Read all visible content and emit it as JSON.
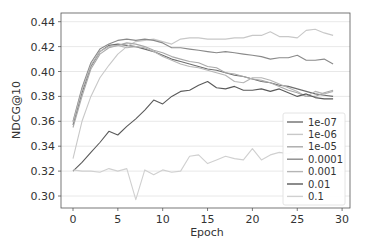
{
  "chart_data": {
    "type": "line",
    "title": "",
    "xlabel": "Epoch",
    "ylabel": "NDCG@10",
    "xlim": [
      -1.3,
      31
    ],
    "ylim": [
      0.29,
      0.445
    ],
    "xticks": [
      0,
      5,
      10,
      15,
      20,
      25,
      30
    ],
    "yticks": [
      0.3,
      0.32,
      0.34,
      0.36,
      0.38,
      0.4,
      0.42,
      0.44
    ],
    "ytick_labels": [
      "0.30",
      "0.32",
      "0.34",
      "0.36",
      "0.38",
      "0.40",
      "0.42",
      "0.44"
    ],
    "grid": "horizontal",
    "legend_position": "lower right",
    "x": [
      0,
      1,
      2,
      3,
      4,
      5,
      6,
      7,
      8,
      9,
      10,
      11,
      12,
      13,
      14,
      15,
      16,
      17,
      18,
      19,
      20,
      21,
      22,
      23,
      24,
      25,
      26,
      27,
      28,
      29
    ],
    "series": [
      {
        "name": "1e-07",
        "color": "#6e6e6e",
        "values": [
          0.357,
          0.383,
          0.404,
          0.416,
          0.421,
          0.422,
          0.421,
          0.42,
          0.418,
          0.416,
          0.413,
          0.41,
          0.408,
          0.406,
          0.404,
          0.402,
          0.401,
          0.399,
          0.397,
          0.396,
          0.394,
          0.392,
          0.391,
          0.389,
          0.388,
          0.386,
          0.384,
          0.382,
          0.381,
          0.38
        ]
      },
      {
        "name": "1e-06",
        "color": "#c8c8c8",
        "values": [
          0.33,
          0.36,
          0.38,
          0.395,
          0.405,
          0.414,
          0.42,
          0.424,
          0.425,
          0.426,
          0.424,
          0.422,
          0.426,
          0.427,
          0.427,
          0.426,
          0.426,
          0.426,
          0.427,
          0.427,
          0.429,
          0.429,
          0.432,
          0.428,
          0.428,
          0.427,
          0.433,
          0.434,
          0.431,
          0.429
        ]
      },
      {
        "name": "1e-05",
        "color": "#a9a9a9",
        "values": [
          0.355,
          0.38,
          0.402,
          0.414,
          0.419,
          0.421,
          0.423,
          0.422,
          0.42,
          0.417,
          0.415,
          0.412,
          0.41,
          0.408,
          0.407,
          0.404,
          0.403,
          0.399,
          0.398,
          0.396,
          0.394,
          0.393,
          0.391,
          0.388,
          0.385,
          0.383,
          0.38,
          0.38,
          0.383,
          0.385
        ]
      },
      {
        "name": "0.0001",
        "color": "#8a8a8a",
        "values": [
          0.36,
          0.387,
          0.407,
          0.418,
          0.422,
          0.425,
          0.426,
          0.425,
          0.426,
          0.425,
          0.423,
          0.419,
          0.419,
          0.418,
          0.417,
          0.416,
          0.415,
          0.416,
          0.415,
          0.414,
          0.413,
          0.412,
          0.41,
          0.411,
          0.411,
          0.413,
          0.409,
          0.409,
          0.41,
          0.406
        ]
      },
      {
        "name": "0.001",
        "color": "#b5b5b5",
        "values": [
          0.359,
          0.385,
          0.405,
          0.416,
          0.42,
          0.421,
          0.419,
          0.42,
          0.419,
          0.416,
          0.412,
          0.409,
          0.406,
          0.404,
          0.403,
          0.401,
          0.399,
          0.397,
          0.392,
          0.391,
          0.395,
          0.395,
          0.393,
          0.39,
          0.387,
          0.384,
          0.38,
          0.384,
          0.382,
          0.384
        ]
      },
      {
        "name": "0.01",
        "color": "#5a5a5a",
        "values": [
          0.32,
          0.327,
          0.335,
          0.343,
          0.352,
          0.349,
          0.356,
          0.362,
          0.369,
          0.377,
          0.374,
          0.38,
          0.384,
          0.385,
          0.389,
          0.392,
          0.387,
          0.386,
          0.388,
          0.385,
          0.385,
          0.386,
          0.384,
          0.386,
          0.383,
          0.38,
          0.382,
          0.379,
          0.378,
          0.378
        ]
      },
      {
        "name": "0.1",
        "color": "#d0d0d0",
        "values": [
          0.321,
          0.32,
          0.32,
          0.319,
          0.322,
          0.32,
          0.322,
          0.297,
          0.321,
          0.317,
          0.321,
          0.319,
          0.32,
          0.332,
          0.333,
          0.326,
          0.329,
          0.332,
          0.33,
          0.329,
          0.338,
          0.329,
          0.333,
          0.335,
          0.334,
          0.337,
          0.339,
          0.336,
          0.34,
          0.338
        ]
      }
    ]
  }
}
